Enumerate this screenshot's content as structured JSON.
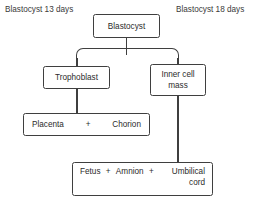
{
  "diagram": {
    "title_left": "Blastocyst 13 days",
    "title_right": "Blastocyst 18 days",
    "line_color": "#3f3f3f",
    "background": "#ffffff",
    "nodes": {
      "blastocyst": {
        "label": "Blastocyst"
      },
      "trophoblast": {
        "label": "Trophoblast"
      },
      "inner_cell_mass": {
        "line1": "Inner cell",
        "line2": "mass"
      },
      "placenta": {
        "part1": "Placenta",
        "operator": "+",
        "part2": "Chorion"
      },
      "fetus": {
        "part1": "Fetus",
        "operator1": "+",
        "part2": "Amnion",
        "operator2": "+",
        "part3": "Umbilical cord"
      }
    },
    "edges": [
      {
        "from": "blastocyst",
        "to": "trophoblast"
      },
      {
        "from": "blastocyst",
        "to": "inner_cell_mass"
      },
      {
        "from": "trophoblast",
        "to": "placenta"
      },
      {
        "from": "inner_cell_mass",
        "to": "fetus"
      }
    ]
  }
}
